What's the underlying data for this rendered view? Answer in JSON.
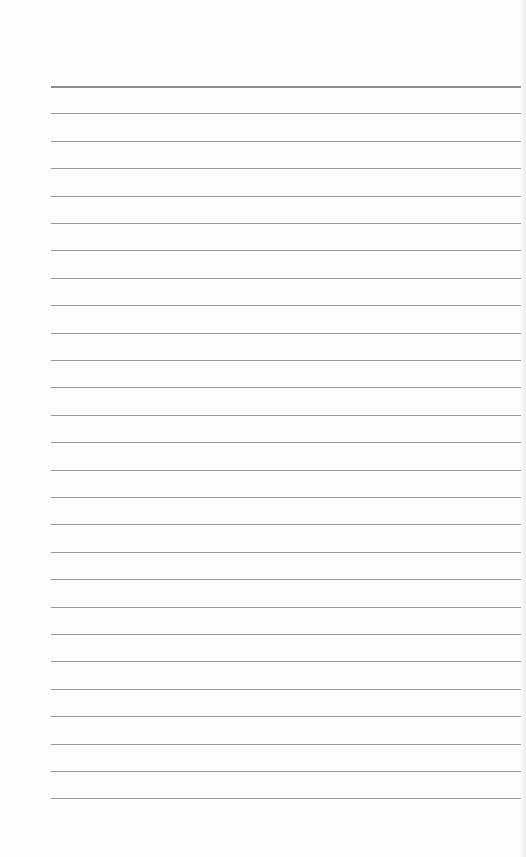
{
  "page": {
    "type": "lined-paper",
    "background_color": "#fdfdfd",
    "line_color": "#9a9a9a",
    "top_line_color": "#8c8c8c",
    "line_count": 27,
    "first_line_y": 86,
    "line_spacing": 27.4,
    "line_left": 51,
    "line_right": 521
  }
}
